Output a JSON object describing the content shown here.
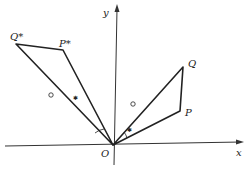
{
  "diagram": {
    "type": "geometry-rotation",
    "axes": {
      "x_label": "x",
      "y_label": "y",
      "origin_label": "O"
    },
    "points": {
      "O": {
        "label": "O",
        "px": [
          113,
          145
        ]
      },
      "P": {
        "label": "P",
        "px": [
          180,
          111
        ]
      },
      "Q": {
        "label": "Q",
        "px": [
          183,
          67
        ]
      },
      "P_star": {
        "label": "P*",
        "px": [
          63,
          50
        ]
      },
      "Q_star": {
        "label": "Q*",
        "px": [
          16,
          44
        ]
      }
    },
    "segments": [
      "OP",
      "PQ",
      "QO",
      "OP*",
      "P*Q*",
      "Q*O"
    ],
    "markers": {
      "OQ": "circle",
      "OQ*": "circle",
      "OP": "cross",
      "OP*": "cross",
      "angle_POQ": "arc",
      "angle_P*OQ*": "arc"
    },
    "stroke_color": "#222222"
  }
}
